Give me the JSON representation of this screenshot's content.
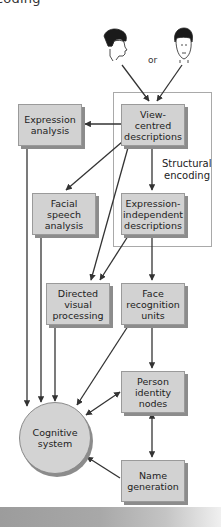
{
  "header": {
    "title_fragment": "coding"
  },
  "faces": {
    "left": {
      "icon": "face-profile-icon"
    },
    "right": {
      "icon": "face-frontal-icon"
    },
    "connector": "or"
  },
  "group": {
    "label": "Structural\nencoding"
  },
  "nodes": {
    "view_centred": {
      "label": "View-centred\ndescriptions"
    },
    "expression_analysis": {
      "label": "Expression\nanalysis"
    },
    "facial_speech": {
      "label": "Facial\nspeech\nanalysis"
    },
    "expression_independent": {
      "label": "Expression-\nindependent\ndescriptions"
    },
    "directed_visual": {
      "label": "Directed\nvisual\nprocessing"
    },
    "face_recognition": {
      "label": "Face\nrecognition\nunits"
    },
    "person_identity": {
      "label": "Person\nidentity\nnodes"
    },
    "cognitive_system": {
      "label": "Cognitive\nsystem"
    },
    "name_generation": {
      "label": "Name\ngeneration"
    }
  },
  "edges": [
    {
      "from": "face_profile",
      "to": "view_centred",
      "type": "one-way"
    },
    {
      "from": "face_frontal",
      "to": "view_centred",
      "type": "one-way"
    },
    {
      "from": "view_centred",
      "to": "expression_analysis",
      "type": "one-way"
    },
    {
      "from": "view_centred",
      "to": "facial_speech",
      "type": "one-way"
    },
    {
      "from": "view_centred",
      "to": "expression_independent",
      "type": "one-way"
    },
    {
      "from": "view_centred",
      "to": "directed_visual",
      "type": "one-way"
    },
    {
      "from": "expression_independent",
      "to": "directed_visual",
      "type": "one-way"
    },
    {
      "from": "expression_independent",
      "to": "face_recognition",
      "type": "one-way"
    },
    {
      "from": "face_recognition",
      "to": "person_identity",
      "type": "one-way"
    },
    {
      "from": "face_recognition",
      "to": "cognitive_system",
      "type": "one-way"
    },
    {
      "from": "expression_analysis",
      "to": "cognitive_system",
      "type": "one-way"
    },
    {
      "from": "facial_speech",
      "to": "cognitive_system",
      "type": "one-way"
    },
    {
      "from": "directed_visual",
      "to": "cognitive_system",
      "type": "one-way"
    },
    {
      "from": "person_identity",
      "to": "cognitive_system",
      "type": "two-way"
    },
    {
      "from": "person_identity",
      "to": "name_generation",
      "type": "two-way"
    },
    {
      "from": "name_generation",
      "to": "cognitive_system",
      "type": "one-way"
    }
  ],
  "colors": {
    "box_fill": "#d2d2d2",
    "box_shadow": "#8c8c8c",
    "arrow": "#333333",
    "frame": "#a9a9a9"
  }
}
